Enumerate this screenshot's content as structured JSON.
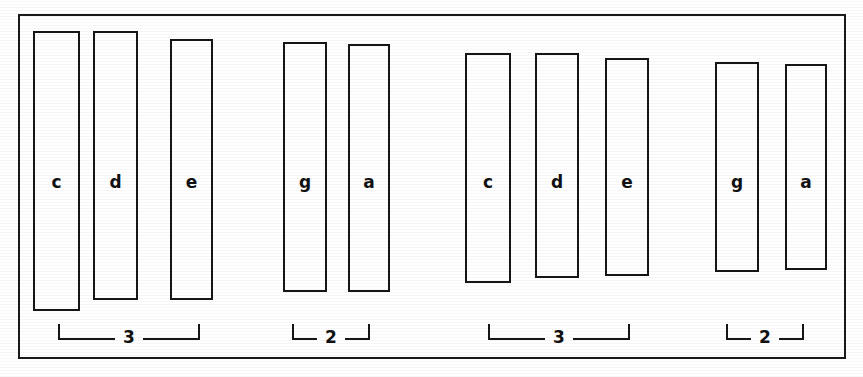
{
  "figure": {
    "kind": "grouped-open-rectangles-diagram",
    "background_color": "#ffffff",
    "ink_color": "#161616",
    "frame": {
      "x": 18,
      "y": 14,
      "width": 828,
      "height": 345
    }
  },
  "chart_data": {
    "type": "bar",
    "title": "",
    "subtitle": "",
    "xlabel": "",
    "ylabel": "",
    "grid": false,
    "legend": null,
    "categories": [
      "c",
      "d",
      "e",
      "g",
      "a",
      "c",
      "d",
      "e",
      "g",
      "a"
    ],
    "values": [
      280,
      269,
      261,
      250,
      248,
      230,
      225,
      218,
      210,
      206
    ],
    "bars": [
      {
        "label": "c",
        "group": 1,
        "x": 33,
        "y": 31,
        "width": 47,
        "height": 280
      },
      {
        "label": "d",
        "group": 1,
        "x": 93,
        "y": 31,
        "width": 45,
        "height": 269
      },
      {
        "label": "e",
        "group": 1,
        "x": 170,
        "y": 39,
        "width": 43,
        "height": 261
      },
      {
        "label": "g",
        "group": 2,
        "x": 283,
        "y": 42,
        "width": 44,
        "height": 250
      },
      {
        "label": "a",
        "group": 2,
        "x": 348,
        "y": 44,
        "width": 42,
        "height": 248
      },
      {
        "label": "c",
        "group": 3,
        "x": 465,
        "y": 53,
        "width": 46,
        "height": 230
      },
      {
        "label": "d",
        "group": 3,
        "x": 535,
        "y": 53,
        "width": 44,
        "height": 225
      },
      {
        "label": "e",
        "group": 3,
        "x": 605,
        "y": 58,
        "width": 44,
        "height": 218
      },
      {
        "label": "g",
        "group": 4,
        "x": 715,
        "y": 62,
        "width": 44,
        "height": 210
      },
      {
        "label": "a",
        "group": 4,
        "x": 785,
        "y": 64,
        "width": 42,
        "height": 206
      }
    ],
    "groups": [
      {
        "count_label": "3",
        "x": 58,
        "width": 142,
        "y": 318
      },
      {
        "count_label": "2",
        "x": 292,
        "width": 78,
        "y": 318
      },
      {
        "count_label": "3",
        "x": 488,
        "width": 142,
        "y": 318
      },
      {
        "count_label": "2",
        "x": 726,
        "width": 78,
        "y": 318
      }
    ],
    "annotations": [
      "Group 1 of 3 items labeled c, d, e",
      "Group 2 of 2 items labeled g, a",
      "Group 3 of 3 items labeled c, d, e",
      "Group 4 of 2 items labeled g, a"
    ]
  }
}
